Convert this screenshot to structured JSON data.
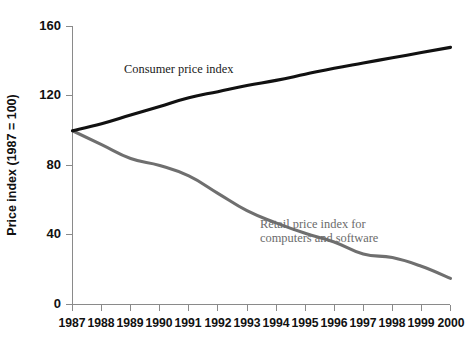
{
  "chart_data": {
    "type": "line",
    "title": "",
    "xlabel": "",
    "ylabel": "Price index (1987 = 100)",
    "xlim": [
      1987,
      2000
    ],
    "ylim": [
      0,
      160
    ],
    "grid": false,
    "legend_position": "inline-annotation",
    "x": [
      1987,
      1988,
      1989,
      1990,
      1991,
      1992,
      1993,
      1994,
      1995,
      1996,
      1997,
      1998,
      1999,
      2000
    ],
    "xtick_labels": [
      "1987",
      "1988",
      "1989",
      "1990",
      "1991",
      "1992",
      "1993",
      "1994",
      "1995",
      "1996",
      "1997",
      "1998",
      "1999",
      "2000"
    ],
    "ytick_values": [
      0,
      40,
      80,
      120,
      160
    ],
    "ytick_labels": [
      "0",
      "40",
      "80",
      "120",
      "160"
    ],
    "series": [
      {
        "name": "Consumer price index",
        "color": "#111111",
        "values": [
          100.0,
          104.0,
          109.0,
          114.0,
          119.0,
          122.5,
          126.0,
          129.0,
          132.5,
          136.0,
          139.0,
          142.0,
          145.0,
          148.0
        ]
      },
      {
        "name": "Retail price index for computers and software",
        "color": "#6f6f6f",
        "values": [
          100.0,
          92.0,
          84.0,
          80.0,
          74.0,
          64.0,
          54.0,
          47.0,
          41.0,
          36.0,
          29.0,
          27.0,
          22.0,
          15.0
        ]
      }
    ],
    "annotations": [
      {
        "id": "cpi-label",
        "lines": [
          "Consumer price index"
        ],
        "x_px": 124,
        "y_px": 73,
        "color": "#1a1a1a"
      },
      {
        "id": "rpi-label",
        "lines": [
          "Retail price index for",
          "computers and software"
        ],
        "x_px": 260,
        "y_px": 228,
        "color": "#6b6b6b"
      }
    ]
  }
}
